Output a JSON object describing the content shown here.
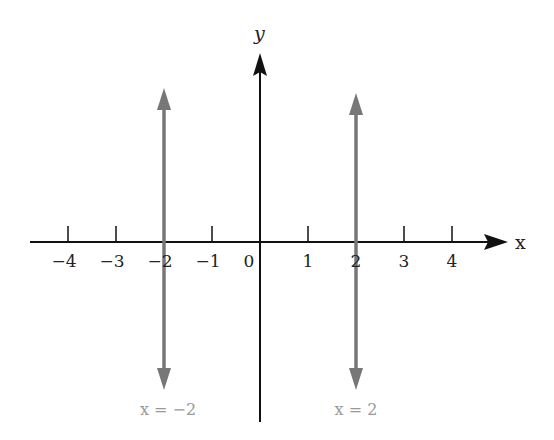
{
  "diagram": {
    "x_axis": {
      "label": "x",
      "ticks": [
        -4,
        -3,
        -2,
        -1,
        0,
        1,
        2,
        3,
        4
      ],
      "tick_labels": [
        "−4",
        "−3",
        "−2",
        "−1",
        "0",
        "1",
        "2",
        "3",
        "4"
      ]
    },
    "y_axis": {
      "label": "y"
    },
    "vertical_lines": [
      {
        "x": -2,
        "label": "x = −2",
        "color": "#777777"
      },
      {
        "x": 2,
        "label": "x = 2",
        "color": "#777777"
      }
    ],
    "axis_color": "#111111",
    "label_color": "#999999"
  }
}
